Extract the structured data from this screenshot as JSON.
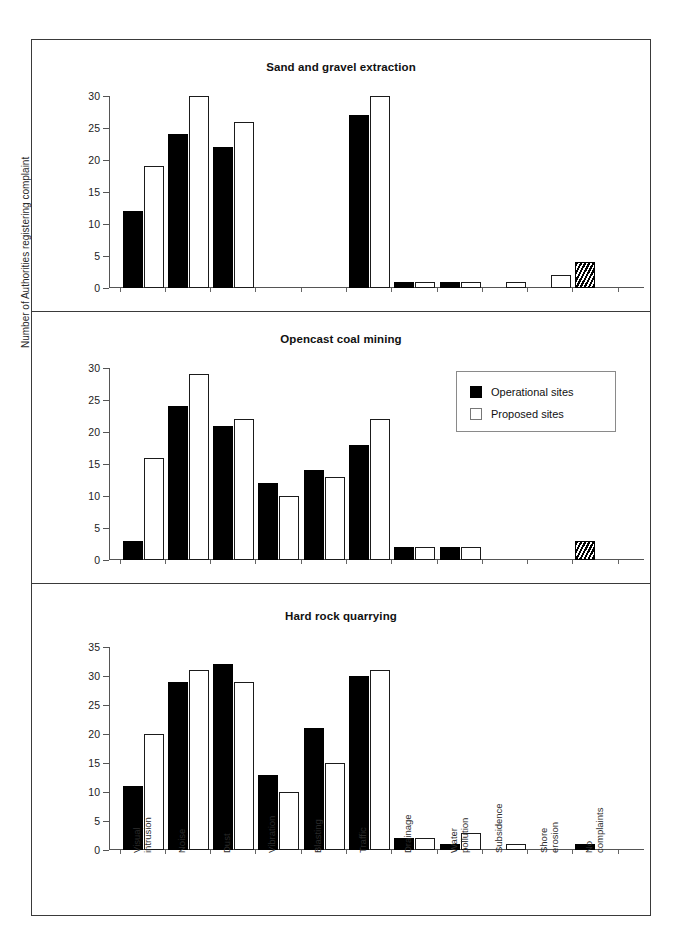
{
  "figure": {
    "y_axis_caption": "Number of Authorities registering complaint",
    "legend": {
      "items": [
        {
          "label": "Operational sites",
          "style": "filled-black",
          "color": "#000000"
        },
        {
          "label": "Proposed sites",
          "style": "outline-white",
          "color": "#ffffff"
        }
      ]
    },
    "categories": [
      "Visual intrusion",
      "Noise",
      "Dust",
      "Vibration",
      "Blasting",
      "Traffic",
      "Drainage",
      "Water pollution",
      "Subsidence",
      "Shore erosion",
      "No complaints"
    ],
    "category_lines": [
      [
        "Visual",
        "intrusion"
      ],
      [
        "Noise"
      ],
      [
        "Dust"
      ],
      [
        "Vibration"
      ],
      [
        "Blasting"
      ],
      [
        "Traffic"
      ],
      [
        "Drainage"
      ],
      [
        "Water",
        "pollution"
      ],
      [
        "Subsidence"
      ],
      [
        "Shore",
        "erosion"
      ],
      [
        "No",
        "complaints"
      ]
    ]
  },
  "chart_data": [
    {
      "type": "bar",
      "title": "Sand and gravel extraction",
      "xlabel": "",
      "ylabel": "Number of Authorities registering complaint",
      "ylim": [
        0,
        30
      ],
      "yticks": [
        0,
        5,
        10,
        15,
        20,
        25,
        30
      ],
      "grid": false,
      "legend_position": "none",
      "categories": [
        "Visual intrusion",
        "Noise",
        "Dust",
        "Vibration",
        "Blasting",
        "Traffic",
        "Drainage",
        "Water pollution",
        "Subsidence",
        "Shore erosion",
        "No complaints"
      ],
      "series": [
        {
          "name": "Operational sites",
          "values": [
            12,
            24,
            22,
            0,
            0,
            27,
            1,
            1,
            0,
            0,
            4
          ]
        },
        {
          "name": "Proposed sites",
          "values": [
            19,
            30,
            26,
            0,
            0,
            30,
            1,
            1,
            1,
            2,
            0
          ]
        }
      ]
    },
    {
      "type": "bar",
      "title": "Opencast coal mining",
      "xlabel": "",
      "ylabel": "Number of Authorities registering complaint",
      "ylim": [
        0,
        30
      ],
      "yticks": [
        0,
        5,
        10,
        15,
        20,
        25,
        30
      ],
      "grid": false,
      "legend_position": "upper right",
      "categories": [
        "Visual intrusion",
        "Noise",
        "Dust",
        "Vibration",
        "Blasting",
        "Traffic",
        "Drainage",
        "Water pollution",
        "Subsidence",
        "Shore erosion",
        "No complaints"
      ],
      "series": [
        {
          "name": "Operational sites",
          "values": [
            3,
            24,
            21,
            12,
            14,
            18,
            2,
            2,
            0,
            0,
            3
          ]
        },
        {
          "name": "Proposed sites",
          "values": [
            16,
            29,
            22,
            10,
            13,
            22,
            2,
            2,
            0,
            0,
            0
          ]
        }
      ]
    },
    {
      "type": "bar",
      "title": "Hard rock quarrying",
      "xlabel": "",
      "ylabel": "Number of Authorities registering complaint",
      "ylim": [
        0,
        35
      ],
      "yticks": [
        0,
        5,
        10,
        15,
        20,
        25,
        30,
        35
      ],
      "grid": false,
      "legend_position": "none",
      "categories": [
        "Visual intrusion",
        "Noise",
        "Dust",
        "Vibration",
        "Blasting",
        "Traffic",
        "Drainage",
        "Water pollution",
        "Subsidence",
        "Shore erosion",
        "No complaints"
      ],
      "series": [
        {
          "name": "Operational sites",
          "values": [
            11,
            29,
            32,
            13,
            21,
            30,
            2,
            1,
            0,
            0,
            1
          ]
        },
        {
          "name": "Proposed sites",
          "values": [
            20,
            31,
            29,
            10,
            15,
            31,
            2,
            3,
            1,
            0,
            0
          ]
        }
      ]
    }
  ]
}
